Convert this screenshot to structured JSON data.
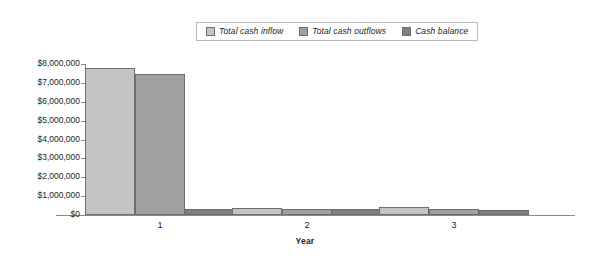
{
  "chart_data": {
    "type": "bar",
    "title": "",
    "subtitle": "",
    "xlabel": "Year",
    "ylabel": "",
    "categories": [
      "1",
      "2",
      "3"
    ],
    "series": [
      {
        "name": "Total cash inflow",
        "color": "#c4c4c4",
        "values": [
          7800000,
          380000,
          400000
        ]
      },
      {
        "name": "Total cash outflows",
        "color": "#a0a0a0",
        "values": [
          7450000,
          330000,
          300000
        ]
      },
      {
        "name": "Cash balance",
        "color": "#808080",
        "values": [
          330000,
          300000,
          290000
        ]
      }
    ],
    "ylim": [
      0,
      8000000
    ],
    "ytick_labels": [
      "$8,000,000",
      "$7,000,000",
      "$6,000,000",
      "$5,000,000",
      "$4,000,000",
      "$3,000,000",
      "$2,000,000",
      "$1,000,000",
      "$0"
    ],
    "ytick_values": [
      8000000,
      7000000,
      6000000,
      5000000,
      4000000,
      3000000,
      2000000,
      1000000,
      0
    ],
    "grid": false,
    "legend_position": "top-center"
  },
  "legend": {
    "entries": [
      {
        "label": "Total cash inflow"
      },
      {
        "label": "Total cash outflows"
      },
      {
        "label": "Cash balance"
      }
    ]
  },
  "axes": {
    "x_title": "Year"
  }
}
